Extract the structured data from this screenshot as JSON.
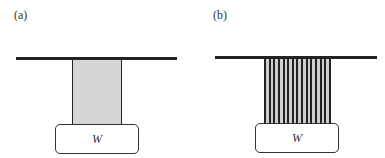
{
  "panels": [
    {
      "label": "(a)",
      "type": "solid-column",
      "weight_label": "W",
      "fill_color": "#d6d6d6"
    },
    {
      "label": "(b)",
      "type": "fiber-bundle",
      "weight_label": "W",
      "strand_count": 15
    }
  ]
}
